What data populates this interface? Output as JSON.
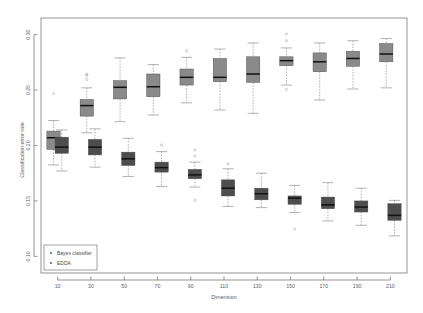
{
  "chart_data": {
    "type": "box",
    "title": "",
    "xlabel": "Dimension",
    "ylabel": "Classification error rate",
    "categories": [
      10,
      30,
      50,
      70,
      90,
      110,
      130,
      150,
      170,
      190,
      210
    ],
    "xticklabels": [
      "10",
      "30",
      "50",
      "70",
      "90",
      "110",
      "130",
      "150",
      "170",
      "190",
      "210"
    ],
    "yticks": [
      0.1,
      0.15,
      0.2,
      0.25,
      0.3
    ],
    "yticklabels": [
      "0.10",
      "0.15",
      "0.20",
      "0.25",
      "0.30"
    ],
    "ylim": [
      0.085,
      0.315
    ],
    "grid": false,
    "legend": {
      "position": "bottom-left",
      "entries": [
        {
          "label": "Bayes classifier",
          "marker": "point",
          "color": "#4d4d4d"
        },
        {
          "label": "EDDA",
          "marker": "point",
          "color": "#8a8a8a"
        }
      ]
    },
    "series": [
      {
        "name": "EDDA",
        "color": "#8a8a8a",
        "boxes": [
          {
            "x": 10,
            "lower_whisker": 0.1825,
            "q1": 0.1965,
            "median": 0.207,
            "q3": 0.213,
            "upper_whisker": 0.2225,
            "outliers": [
              0.247
            ]
          },
          {
            "x": 30,
            "lower_whisker": 0.2115,
            "q1": 0.2265,
            "median": 0.236,
            "q3": 0.2415,
            "upper_whisker": 0.252,
            "outliers": [
              0.2595,
              0.2635,
              0.264
            ]
          },
          {
            "x": 50,
            "lower_whisker": 0.2215,
            "q1": 0.242,
            "median": 0.2525,
            "q3": 0.2585,
            "upper_whisker": 0.279,
            "outliers": []
          },
          {
            "x": 70,
            "lower_whisker": 0.2275,
            "q1": 0.244,
            "median": 0.253,
            "q3": 0.2645,
            "upper_whisker": 0.273,
            "outliers": []
          },
          {
            "x": 90,
            "lower_whisker": 0.2385,
            "q1": 0.2545,
            "median": 0.2615,
            "q3": 0.269,
            "upper_whisker": 0.2795,
            "outliers": [
              0.2855
            ]
          },
          {
            "x": 110,
            "lower_whisker": 0.232,
            "q1": 0.2575,
            "median": 0.2615,
            "q3": 0.2785,
            "upper_whisker": 0.287,
            "outliers": []
          },
          {
            "x": 130,
            "lower_whisker": 0.229,
            "q1": 0.257,
            "median": 0.2645,
            "q3": 0.28,
            "upper_whisker": 0.2925,
            "outliers": []
          },
          {
            "x": 150,
            "lower_whisker": 0.2545,
            "q1": 0.272,
            "median": 0.2765,
            "q3": 0.28,
            "upper_whisker": 0.288,
            "outliers": [
              0.2945,
              0.3005,
              0.2505
            ]
          },
          {
            "x": 170,
            "lower_whisker": 0.241,
            "q1": 0.2665,
            "median": 0.2755,
            "q3": 0.2835,
            "upper_whisker": 0.2925,
            "outliers": []
          },
          {
            "x": 190,
            "lower_whisker": 0.251,
            "q1": 0.2715,
            "median": 0.2785,
            "q3": 0.285,
            "upper_whisker": 0.2945,
            "outliers": []
          },
          {
            "x": 210,
            "lower_whisker": 0.252,
            "q1": 0.2755,
            "median": 0.2825,
            "q3": 0.292,
            "upper_whisker": 0.2965,
            "outliers": []
          }
        ]
      },
      {
        "name": "Bayes classifier",
        "color": "#4d4d4d",
        "boxes": [
          {
            "x": 10,
            "lower_whisker": 0.177,
            "q1": 0.193,
            "median": 0.1985,
            "q3": 0.2075,
            "upper_whisker": 0.214,
            "outliers": []
          },
          {
            "x": 30,
            "lower_whisker": 0.1805,
            "q1": 0.1915,
            "median": 0.1985,
            "q3": 0.2055,
            "upper_whisker": 0.215,
            "outliers": []
          },
          {
            "x": 50,
            "lower_whisker": 0.172,
            "q1": 0.182,
            "median": 0.188,
            "q3": 0.194,
            "upper_whisker": 0.2065,
            "outliers": []
          },
          {
            "x": 70,
            "lower_whisker": 0.163,
            "q1": 0.176,
            "median": 0.18,
            "q3": 0.185,
            "upper_whisker": 0.1945,
            "outliers": [
              0.2005
            ]
          },
          {
            "x": 90,
            "lower_whisker": 0.1625,
            "q1": 0.17,
            "median": 0.1735,
            "q3": 0.1785,
            "upper_whisker": 0.185,
            "outliers": [
              0.1505,
              0.1905,
              0.196
            ]
          },
          {
            "x": 110,
            "lower_whisker": 0.145,
            "q1": 0.1545,
            "median": 0.1615,
            "q3": 0.169,
            "upper_whisker": 0.179,
            "outliers": [
              0.1835
            ]
          },
          {
            "x": 130,
            "lower_whisker": 0.144,
            "q1": 0.151,
            "median": 0.1565,
            "q3": 0.1615,
            "upper_whisker": 0.175,
            "outliers": []
          },
          {
            "x": 150,
            "lower_whisker": 0.1395,
            "q1": 0.147,
            "median": 0.1525,
            "q3": 0.1545,
            "upper_whisker": 0.164,
            "outliers": [
              0.1245
            ]
          },
          {
            "x": 170,
            "lower_whisker": 0.132,
            "q1": 0.143,
            "median": 0.1465,
            "q3": 0.1535,
            "upper_whisker": 0.1665,
            "outliers": []
          },
          {
            "x": 190,
            "lower_whisker": 0.128,
            "q1": 0.14,
            "median": 0.1445,
            "q3": 0.15,
            "upper_whisker": 0.1615,
            "outliers": []
          },
          {
            "x": 210,
            "lower_whisker": 0.1185,
            "q1": 0.1325,
            "median": 0.137,
            "q3": 0.1475,
            "upper_whisker": 0.1505,
            "outliers": []
          }
        ]
      }
    ]
  }
}
